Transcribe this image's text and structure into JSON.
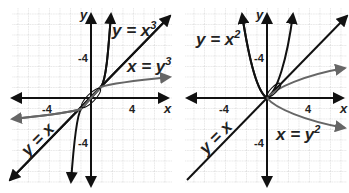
{
  "graphs": [
    {
      "id": "left",
      "axis_labels": {
        "x": "x",
        "y": "y"
      },
      "ticks": {
        "x_neg": "-4",
        "x_pos": "4",
        "y_upper": "-4",
        "y_lower": "-4"
      },
      "curves": [
        {
          "label": "y = x³",
          "text": "y = x",
          "sup": "3",
          "color": "#111111"
        },
        {
          "label": "x = y³",
          "text": "x = y",
          "sup": "3",
          "color": "#666666"
        },
        {
          "label": "y = x",
          "text": "y = x",
          "sup": "",
          "color": "#111111"
        }
      ]
    },
    {
      "id": "right",
      "axis_labels": {
        "x": "x",
        "y": "y"
      },
      "ticks": {
        "x_neg": "-4",
        "x_pos": "4",
        "y_upper": "-4",
        "y_lower": "-4"
      },
      "curves": [
        {
          "label": "y = x²",
          "text": "y = x",
          "sup": "2",
          "color": "#111111"
        },
        {
          "label": "x = y²",
          "text": "x = y",
          "sup": "2",
          "color": "#666666"
        },
        {
          "label": "y = x",
          "text": "y = x",
          "sup": "",
          "color": "#111111"
        }
      ]
    }
  ]
}
